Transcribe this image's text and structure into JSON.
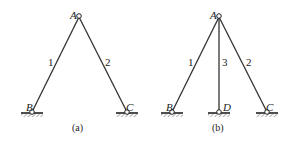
{
  "figures": [
    {
      "caption": "(a)",
      "joints": {
        "A": "A",
        "B": "B",
        "C": "C"
      },
      "bars": [
        "1",
        "2"
      ]
    },
    {
      "caption": "(b)",
      "joints": {
        "A": "A",
        "B": "B",
        "C": "C",
        "D": "D"
      },
      "bars": [
        "1",
        "3",
        "2"
      ]
    }
  ],
  "colors": {
    "line": "#333333",
    "hatch": "#555555",
    "background": "#ffffff"
  }
}
